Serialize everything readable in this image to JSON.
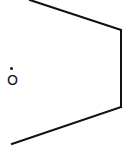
{
  "diagram": {
    "type": "chemical-structure-fragment",
    "atoms": [
      {
        "id": "O1",
        "label": "O",
        "radical": true,
        "x": 12,
        "y": 81
      }
    ],
    "bonds": [
      {
        "from": [
          30,
          0
        ],
        "to": [
          121,
          30
        ]
      },
      {
        "from": [
          121,
          30
        ],
        "to": [
          121,
          107
        ]
      },
      {
        "from": [
          121,
          107
        ],
        "to": [
          12,
          144
        ]
      }
    ],
    "colors": {
      "stroke": "#111111",
      "background": "#ffffff"
    }
  }
}
